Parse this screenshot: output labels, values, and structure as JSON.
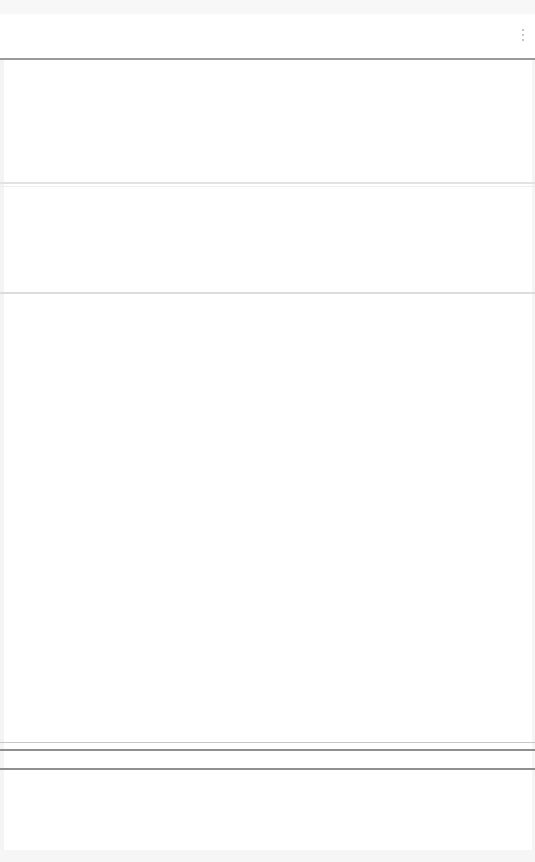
{
  "header": {
    "menu_icon": "kebab-vertical-icon"
  },
  "section": {},
  "content": {},
  "footer": {}
}
